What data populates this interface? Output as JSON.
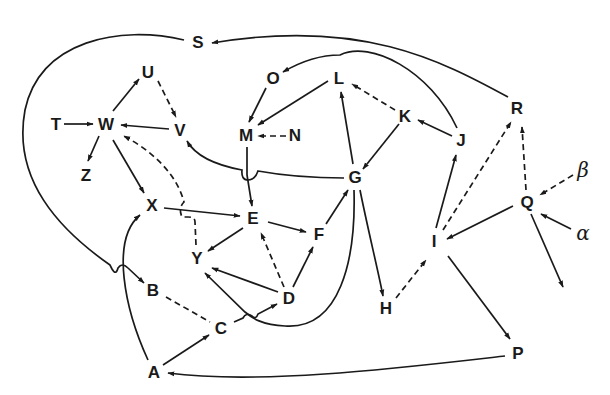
{
  "diagram": {
    "type": "directed-graph",
    "legend": {
      "solid": "solid arrow",
      "dashed": "dashed arrow"
    },
    "nodes": [
      {
        "id": "S",
        "label": "S",
        "x": 198,
        "y": 42
      },
      {
        "id": "U",
        "label": "U",
        "x": 148,
        "y": 72
      },
      {
        "id": "O",
        "label": "O",
        "x": 272,
        "y": 78
      },
      {
        "id": "L",
        "label": "L",
        "x": 339,
        "y": 78
      },
      {
        "id": "T",
        "label": "T",
        "x": 56,
        "y": 124
      },
      {
        "id": "W",
        "label": "W",
        "x": 106,
        "y": 124
      },
      {
        "id": "V",
        "label": "V",
        "x": 180,
        "y": 130
      },
      {
        "id": "M",
        "label": "M",
        "x": 246,
        "y": 135
      },
      {
        "id": "N",
        "label": "N",
        "x": 295,
        "y": 135
      },
      {
        "id": "K",
        "label": "K",
        "x": 404,
        "y": 116
      },
      {
        "id": "J",
        "label": "J",
        "x": 460,
        "y": 140
      },
      {
        "id": "R",
        "label": "R",
        "x": 517,
        "y": 108
      },
      {
        "id": "Z",
        "label": "Z",
        "x": 86,
        "y": 175
      },
      {
        "id": "G",
        "label": "G",
        "x": 355,
        "y": 177
      },
      {
        "id": "X",
        "label": "X",
        "x": 152,
        "y": 205
      },
      {
        "id": "E",
        "label": "E",
        "x": 253,
        "y": 218
      },
      {
        "id": "F",
        "label": "F",
        "x": 319,
        "y": 234
      },
      {
        "id": "Y",
        "label": "Y",
        "x": 197,
        "y": 258
      },
      {
        "id": "Q",
        "label": "Q",
        "x": 527,
        "y": 202
      },
      {
        "id": "beta",
        "label": "β",
        "x": 582,
        "y": 170
      },
      {
        "id": "alpha",
        "label": "α",
        "x": 582,
        "y": 235
      },
      {
        "id": "I",
        "label": "I",
        "x": 434,
        "y": 241
      },
      {
        "id": "B",
        "label": "B",
        "x": 153,
        "y": 290
      },
      {
        "id": "D",
        "label": "D",
        "x": 289,
        "y": 298
      },
      {
        "id": "H",
        "label": "H",
        "x": 386,
        "y": 308
      },
      {
        "id": "C",
        "label": "C",
        "x": 220,
        "y": 328
      },
      {
        "id": "P",
        "label": "P",
        "x": 517,
        "y": 353
      },
      {
        "id": "A",
        "label": "A",
        "x": 154,
        "y": 372
      }
    ],
    "edges": [
      {
        "from": "R",
        "to": "S",
        "style": "solid",
        "curved": true
      },
      {
        "from": "S",
        "to": "B",
        "style": "solid",
        "curved": true
      },
      {
        "from": "J",
        "to": "O",
        "style": "solid",
        "curved": true
      },
      {
        "from": "O",
        "to": "M",
        "style": "solid"
      },
      {
        "from": "L",
        "to": "M",
        "style": "solid"
      },
      {
        "from": "N",
        "to": "M",
        "style": "dashed"
      },
      {
        "from": "K",
        "to": "L",
        "style": "dashed"
      },
      {
        "from": "J",
        "to": "K",
        "style": "solid"
      },
      {
        "from": "K",
        "to": "G",
        "style": "solid"
      },
      {
        "from": "G",
        "to": "L",
        "style": "solid"
      },
      {
        "from": "G",
        "to": "V",
        "style": "solid",
        "curved": true
      },
      {
        "from": "M",
        "to": "E",
        "style": "solid"
      },
      {
        "from": "T",
        "to": "W",
        "style": "solid"
      },
      {
        "from": "W",
        "to": "U",
        "style": "solid"
      },
      {
        "from": "U",
        "to": "V",
        "style": "dashed"
      },
      {
        "from": "V",
        "to": "W",
        "style": "solid"
      },
      {
        "from": "W",
        "to": "Z",
        "style": "solid"
      },
      {
        "from": "W",
        "to": "X",
        "style": "solid"
      },
      {
        "from": "Y",
        "to": "W",
        "style": "dashed",
        "curved": true
      },
      {
        "from": "X",
        "to": "E",
        "style": "solid"
      },
      {
        "from": "E",
        "to": "Y",
        "style": "solid"
      },
      {
        "from": "E",
        "to": "F",
        "style": "solid"
      },
      {
        "from": "F",
        "to": "G",
        "style": "solid"
      },
      {
        "from": "D",
        "to": "E",
        "style": "dashed"
      },
      {
        "from": "D",
        "to": "F",
        "style": "solid"
      },
      {
        "from": "D",
        "to": "Y",
        "style": "solid"
      },
      {
        "from": "G",
        "to": "Y",
        "style": "solid",
        "curved": true
      },
      {
        "from": "G",
        "to": "H",
        "style": "solid"
      },
      {
        "from": "H",
        "to": "I",
        "style": "dashed"
      },
      {
        "from": "I",
        "to": "J",
        "style": "solid"
      },
      {
        "from": "I",
        "to": "R",
        "style": "dashed"
      },
      {
        "from": "Q",
        "to": "R",
        "style": "dashed"
      },
      {
        "from": "Q",
        "to": "I",
        "style": "solid"
      },
      {
        "from": "beta",
        "to": "Q",
        "style": "dashed"
      },
      {
        "from": "alpha",
        "to": "Q",
        "style": "solid"
      },
      {
        "from": "Q",
        "to": "(off)",
        "style": "solid"
      },
      {
        "from": "I",
        "to": "P",
        "style": "solid"
      },
      {
        "from": "P",
        "to": "A",
        "style": "solid",
        "curved": true
      },
      {
        "from": "A",
        "to": "C",
        "style": "solid"
      },
      {
        "from": "A",
        "to": "X",
        "style": "solid",
        "curved": true
      },
      {
        "from": "B",
        "to": "C",
        "style": "dashed",
        "arrow": false
      },
      {
        "from": "C",
        "to": "D",
        "style": "solid"
      }
    ]
  },
  "labels": {
    "S": "S",
    "U": "U",
    "O": "O",
    "L": "L",
    "T": "T",
    "W": "W",
    "V": "V",
    "M": "M",
    "N": "N",
    "K": "K",
    "J": "J",
    "R": "R",
    "Z": "Z",
    "G": "G",
    "X": "X",
    "E": "E",
    "F": "F",
    "Y": "Y",
    "Q": "Q",
    "beta": "β",
    "alpha": "α",
    "I": "I",
    "B": "B",
    "D": "D",
    "H": "H",
    "C": "C",
    "P": "P",
    "A": "A"
  }
}
